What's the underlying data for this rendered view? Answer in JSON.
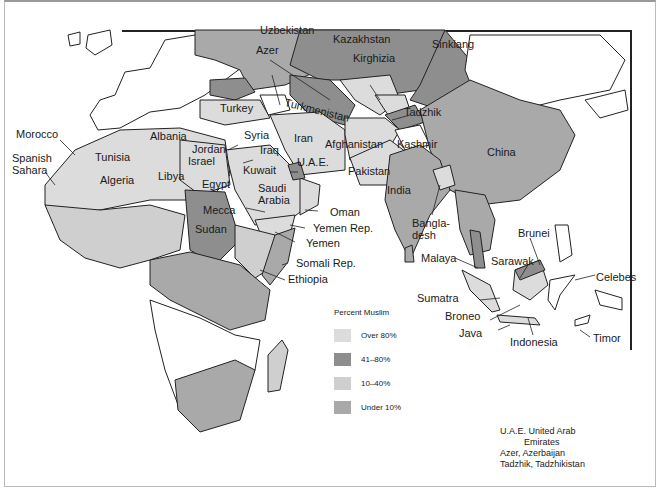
{
  "map": {
    "title": "Percent Muslim distribution map",
    "colors": {
      "over_80": "#dcdcdc",
      "41_80": "#8e8e8e",
      "10_40": "#cfcfcf",
      "under_10": "#a9a9a9",
      "none": "#ffffff",
      "border": "#222222"
    },
    "labels": {
      "uzbekistan": "Uzbekistan",
      "kazakhstan": "Kazakhstan",
      "azer": "Azer",
      "kirghizia": "Kirghizia",
      "sinkiang": "Sinkiang",
      "turkey": "Turkey",
      "turkmenistan": "Turkmenistan",
      "tadzhik": "Tadzhik",
      "morocco": "Morocco",
      "albania": "Albania",
      "syria": "Syria",
      "iran": "Iran",
      "spanish_sahara": "Spanish\nSahara",
      "tunisia": "Tunisia",
      "jordan": "Jordan",
      "israel": "Israel",
      "iraq": "Iraq",
      "afghanistan": "Afghanistan",
      "kashmir": "Kashmir",
      "uae": "U.A.E.",
      "algeria": "Algeria",
      "libya": "Libya",
      "kuwait": "Kuwait",
      "pakistan": "Pakistan",
      "china": "China",
      "egypt": "Egypt",
      "saudi_arabia": "Saudi\nArabia",
      "india": "India",
      "oman": "Oman",
      "mecca": "Mecca",
      "yemen_rep": "Yemen Rep.",
      "bangladesh": "Bangla-\ndesh",
      "sudan": "Sudan",
      "yemen": "Yemen",
      "brunei": "Brunei",
      "somali_rep": "Somali Rep.",
      "malaya": "Malaya",
      "sarawak": "Sarawak",
      "ethiopia": "Ethiopia",
      "celebes": "Celebes",
      "sumatra": "Sumatra",
      "broneo": "Broneo",
      "java": "Java",
      "indonesia": "Indonesia",
      "timor": "Timor"
    }
  },
  "legend": {
    "title": "Percent Muslim",
    "items": [
      {
        "label": "Over 80%",
        "color": "#dcdcdc"
      },
      {
        "label": "41–80%",
        "color": "#8e8e8e"
      },
      {
        "label": "10–40%",
        "color": "#cfcfcf"
      },
      {
        "label": "Under 10%",
        "color": "#a9a9a9"
      }
    ]
  },
  "notes": {
    "line1": "U.A.E. United Arab",
    "line2": "Emirates",
    "line3": "Azer, Azerbaijan",
    "line4": "Tadzhik, Tadzhikistan"
  }
}
